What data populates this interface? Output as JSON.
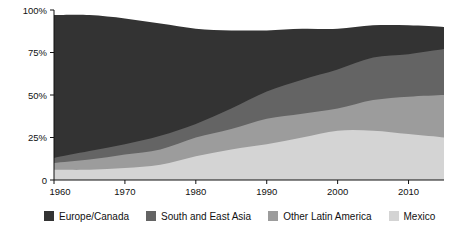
{
  "chart_data": {
    "type": "area",
    "stacked": true,
    "title": "",
    "subtitle": "",
    "xlabel": "",
    "ylabel": "",
    "x": [
      1960,
      1965,
      1970,
      1975,
      1980,
      1985,
      1990,
      1995,
      2000,
      2005,
      2010,
      2015
    ],
    "xlim": [
      1960,
      2015
    ],
    "ylim": [
      0,
      100
    ],
    "grid": false,
    "legend_position": "bottom",
    "xticks": [
      1960,
      1970,
      1980,
      1990,
      2000,
      2010
    ],
    "xtick_labels": [
      "1960",
      "1970",
      "1980",
      "1990",
      "2000",
      "2010"
    ],
    "yticks": [
      0,
      25,
      50,
      75,
      100
    ],
    "ytick_labels": [
      "0",
      "25%",
      "50%",
      "75%",
      "100%"
    ],
    "series": [
      {
        "name": "Mexico",
        "color": "#d4d4d4",
        "values": [
          6,
          6,
          7,
          9,
          14,
          18,
          21,
          25,
          29,
          29,
          27,
          25
        ]
      },
      {
        "name": "Other Latin America",
        "color": "#9c9c9c",
        "values": [
          4,
          6,
          8,
          9,
          11,
          12,
          15,
          14,
          13,
          18,
          22,
          25
        ]
      },
      {
        "name": "South and East Asia",
        "color": "#646464",
        "values": [
          3,
          5,
          6,
          8,
          8,
          12,
          16,
          20,
          23,
          25,
          25,
          27
        ]
      },
      {
        "name": "Europe/Canada",
        "color": "#333333",
        "values": [
          84,
          80,
          74,
          66,
          56,
          46,
          36,
          30,
          24,
          19,
          17,
          13
        ]
      }
    ],
    "cumulative_top_boundaries": {
      "Mexico": [
        6,
        6,
        7,
        9,
        14,
        18,
        21,
        25,
        29,
        29,
        27,
        25
      ],
      "Other Latin America": [
        10,
        12,
        15,
        18,
        25,
        30,
        36,
        39,
        42,
        47,
        49,
        50
      ],
      "South and East Asia": [
        13,
        17,
        21,
        26,
        33,
        42,
        52,
        59,
        65,
        72,
        74,
        77
      ],
      "Europe/Canada": [
        97,
        97,
        95,
        92,
        89,
        88,
        88,
        89,
        89,
        91,
        91,
        90
      ]
    }
  },
  "legend": {
    "items": [
      {
        "label": "Europe/Canada",
        "color": "#333333"
      },
      {
        "label": "South and East Asia",
        "color": "#646464"
      },
      {
        "label": "Other Latin America",
        "color": "#9c9c9c"
      },
      {
        "label": "Mexico",
        "color": "#d4d4d4"
      }
    ]
  },
  "axes": {
    "y_tick_labels": [
      "100%",
      "75%",
      "50%",
      "25%",
      "0"
    ],
    "x_tick_labels": [
      "1960",
      "1970",
      "1980",
      "1990",
      "2000",
      "2010"
    ],
    "axis_color": "#111111"
  }
}
